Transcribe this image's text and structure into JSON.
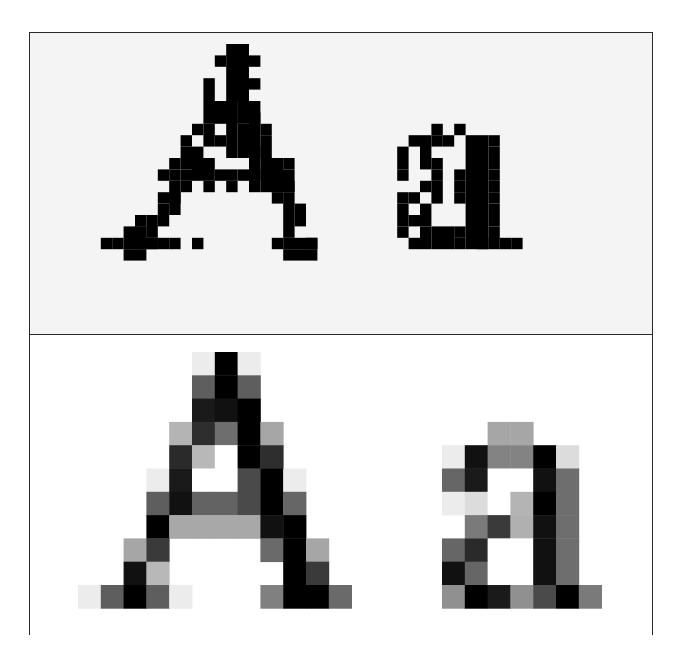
{
  "figure": {
    "letters": [
      "A",
      "a"
    ],
    "top_panel": {
      "description": "Binary dithered (halftone) rendering",
      "background": "#f4f4f4",
      "ink": "#000000",
      "cell": 11.4,
      "origin": [
        78,
        44
      ],
      "dots": [
        [
          12,
          1,
          1,
          1
        ],
        [
          13,
          0,
          2,
          5
        ],
        [
          15,
          1,
          1,
          1
        ],
        [
          11,
          3,
          1,
          2
        ],
        [
          15,
          3,
          1,
          1
        ],
        [
          11,
          5,
          3,
          2
        ],
        [
          13,
          5,
          1,
          5
        ],
        [
          14,
          5,
          2,
          2
        ],
        [
          15,
          6,
          1,
          4
        ],
        [
          10,
          7,
          1,
          1
        ],
        [
          11,
          7,
          1,
          2
        ],
        [
          14,
          7,
          1,
          3
        ],
        [
          16,
          7,
          1,
          1
        ],
        [
          9,
          8,
          1,
          1
        ],
        [
          10,
          9,
          1,
          2
        ],
        [
          12,
          8,
          1,
          1
        ],
        [
          16,
          8,
          1,
          2
        ],
        [
          15,
          9,
          1,
          3
        ],
        [
          9,
          9,
          1,
          2
        ],
        [
          8,
          10,
          1,
          1
        ],
        [
          10,
          10,
          2,
          2
        ],
        [
          16,
          10,
          2,
          3
        ],
        [
          18,
          10,
          1,
          1
        ],
        [
          7,
          11,
          1,
          1
        ],
        [
          8,
          11,
          1,
          1
        ],
        [
          9,
          11,
          1,
          1
        ],
        [
          12,
          11,
          2,
          1
        ],
        [
          14,
          11,
          1,
          1
        ],
        [
          15,
          11,
          1,
          1
        ],
        [
          17,
          11,
          2,
          2
        ],
        [
          8,
          12,
          1,
          2
        ],
        [
          9,
          12,
          1,
          1
        ],
        [
          11,
          12,
          1,
          1
        ],
        [
          13,
          12,
          1,
          1
        ],
        [
          15,
          12,
          1,
          1
        ],
        [
          17,
          12,
          2,
          1
        ],
        [
          7,
          13,
          1,
          1
        ],
        [
          7,
          14,
          1,
          2
        ],
        [
          8,
          13,
          1,
          2
        ],
        [
          17,
          13,
          1,
          1
        ],
        [
          18,
          13,
          1,
          4
        ],
        [
          19,
          14,
          1,
          1
        ],
        [
          5,
          15,
          1,
          1
        ],
        [
          6,
          15,
          1,
          2
        ],
        [
          5,
          16,
          1,
          1
        ],
        [
          19,
          15,
          1,
          1
        ],
        [
          4,
          16,
          2,
          2
        ],
        [
          5,
          17,
          2,
          1
        ],
        [
          6,
          17,
          1,
          1
        ],
        [
          3,
          17,
          1,
          1
        ],
        [
          8,
          17,
          1,
          1
        ],
        [
          2,
          17,
          1,
          1
        ],
        [
          10,
          17,
          1,
          1
        ],
        [
          7,
          17,
          1,
          1
        ],
        [
          17,
          17,
          1,
          1
        ],
        [
          18,
          17,
          3,
          1
        ],
        [
          20,
          17,
          1,
          1
        ],
        [
          4,
          18,
          2,
          1
        ],
        [
          18,
          18,
          3,
          1
        ],
        [
          31,
          7,
          1,
          1
        ],
        [
          33,
          7,
          1,
          1
        ],
        [
          29,
          8,
          1,
          1
        ],
        [
          30,
          8,
          1,
          2
        ],
        [
          31,
          8,
          1,
          1
        ],
        [
          32,
          8,
          1,
          1
        ],
        [
          34,
          8,
          2,
          10
        ],
        [
          36,
          8,
          1,
          1
        ],
        [
          28,
          9,
          1,
          2
        ],
        [
          30,
          10,
          1,
          1
        ],
        [
          31,
          10,
          1,
          1
        ],
        [
          36,
          9,
          1,
          2
        ],
        [
          28,
          11,
          1,
          1
        ],
        [
          31,
          11,
          1,
          1
        ],
        [
          33,
          11,
          1,
          1
        ],
        [
          36,
          11,
          1,
          1
        ],
        [
          30,
          12,
          1,
          1
        ],
        [
          31,
          12,
          1,
          2
        ],
        [
          33,
          12,
          1,
          1
        ],
        [
          36,
          12,
          1,
          1
        ],
        [
          28,
          13,
          1,
          1
        ],
        [
          29,
          13,
          1,
          1
        ],
        [
          30,
          14,
          1,
          1
        ],
        [
          33,
          13,
          1,
          1
        ],
        [
          36,
          13,
          1,
          1
        ],
        [
          28,
          14,
          1,
          2
        ],
        [
          29,
          15,
          1,
          1
        ],
        [
          30,
          15,
          1,
          1
        ],
        [
          36,
          14,
          1,
          2
        ],
        [
          28,
          16,
          1,
          1
        ],
        [
          30,
          16,
          1,
          2
        ],
        [
          31,
          16,
          2,
          2
        ],
        [
          33,
          16,
          1,
          1
        ],
        [
          36,
          16,
          1,
          2
        ],
        [
          29,
          17,
          1,
          1
        ],
        [
          33,
          17,
          1,
          1
        ],
        [
          35,
          17,
          1,
          1
        ],
        [
          37,
          17,
          1,
          1
        ],
        [
          38,
          17,
          1,
          1
        ]
      ]
    },
    "bottom_panel": {
      "description": "Grayscale anti-aliased low-resolution rendering",
      "background": "#ffffff",
      "cell_w": 22.8,
      "cell_h": 23.3,
      "origin": [
        78,
        352
      ],
      "letter_A": {
        "col_offset": 0,
        "row_offset": 0,
        "rows": [
          [
            "",
            "",
            "",
            "",
            "",
            "#ececec",
            "#000000",
            "#ececec",
            "",
            "",
            "",
            ""
          ],
          [
            "",
            "",
            "",
            "",
            "",
            "#5e5e5e",
            "#000000",
            "#5e5e5e",
            "",
            "",
            "",
            ""
          ],
          [
            "",
            "",
            "",
            "",
            "",
            "#1a1a1a",
            "#111111",
            "#000000",
            "",
            "",
            "",
            ""
          ],
          [
            "",
            "",
            "",
            "",
            "#b4b4b4",
            "#2e2e2e",
            "#6e6e6e",
            "#000000",
            "#a6a6a6",
            "",
            "",
            ""
          ],
          [
            "",
            "",
            "",
            "",
            "#2a2a2a",
            "#b8b8b8",
            "#ffffff",
            "#000000",
            "#2e2e2e",
            "",
            "",
            ""
          ],
          [
            "",
            "",
            "",
            "#ececec",
            "#1a1a1a",
            "#ffffff",
            "#ffffff",
            "#4a4a4a",
            "#000000",
            "#ececec",
            "",
            ""
          ],
          [
            "",
            "",
            "",
            "#5e5e5e",
            "#111111",
            "#636363",
            "#636363",
            "#4a4a4a",
            "#000000",
            "#666666",
            "",
            ""
          ],
          [
            "",
            "",
            "",
            "#000000",
            "#a8a8a8",
            "#a8a8a8",
            "#a8a8a8",
            "#a8a8a8",
            "#111111",
            "#000000",
            "",
            ""
          ],
          [
            "",
            "",
            "#a6a6a6",
            "#3a3a3a",
            "",
            "",
            "",
            "",
            "#6a6a6a",
            "#000000",
            "#a6a6a6",
            ""
          ],
          [
            "",
            "",
            "#111111",
            "#b8b8b8",
            "",
            "",
            "",
            "",
            "",
            "#000000",
            "#3a3a3a",
            ""
          ],
          [
            "#ececec",
            "#5e5e5e",
            "#000000",
            "#5e5e5e",
            "#ececec",
            "",
            "",
            "",
            "#808080",
            "#000000",
            "#000000",
            "#6a6a6a"
          ]
        ]
      },
      "letter_a": {
        "x": 442,
        "row_offset": 3,
        "rows": [
          [
            "",
            "",
            "#a6a6a6",
            "#a6a6a6",
            "",
            "",
            ""
          ],
          [
            "#ececec",
            "#111111",
            "#838383",
            "#838383",
            "#000000",
            "#dcdcdc",
            ""
          ],
          [
            "#666666",
            "#1a1a1a",
            "#ffffff",
            "#ffffff",
            "#111111",
            "#6e6e6e",
            ""
          ],
          [
            "#ececec",
            "#dcdcdc",
            "#ffffff",
            "#b4b4b4",
            "#000000",
            "#6e6e6e",
            ""
          ],
          [
            "",
            "#7a7a7a",
            "#3a3a3a",
            "#b0b0b0",
            "#111111",
            "#6e6e6e",
            ""
          ],
          [
            "#666666",
            "#2a2a2a",
            "#ffffff",
            "#ffffff",
            "#111111",
            "#6e6e6e",
            ""
          ],
          [
            "#111111",
            "#666666",
            "#ffffff",
            "#ffffff",
            "#111111",
            "#6e6e6e",
            ""
          ],
          [
            "#909090",
            "#000000",
            "#1a1a1a",
            "#909090",
            "#4a4a4a",
            "#000000",
            "#7a7a7a"
          ]
        ]
      }
    },
    "border_color": "#2a2a2a"
  }
}
